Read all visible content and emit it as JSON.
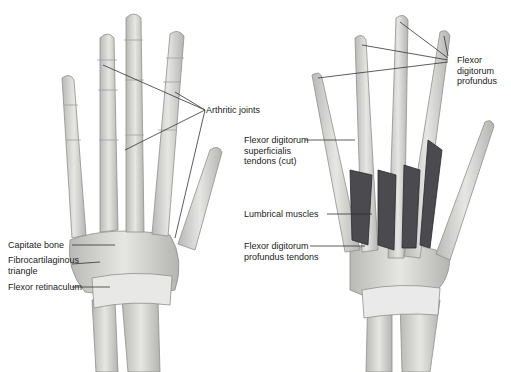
{
  "left_hand": {
    "labels": {
      "arthritic_joints": "Arthritic joints",
      "capitate_bone": "Capitate bone",
      "fibrocartilaginous_1": "Fibrocartilaginous",
      "fibrocartilaginous_2": "triangle",
      "flexor_retinaculum": "Flexor retinaculum"
    }
  },
  "right_hand": {
    "labels": {
      "fdp_1": "Flexor",
      "fdp_2": "digitorum",
      "fdp_3": "profundus",
      "fds_1": "Flexor digitorum",
      "fds_2": "superficialis",
      "fds_3": "tendons (cut)",
      "lumbrical": "Lumbrical muscles",
      "fdpt_1": "Flexor digitorum",
      "fdpt_2": "profundus tendons"
    }
  },
  "colors": {
    "bone": "#d9d9d6",
    "bone_edge": "#8f8f8c",
    "muscle": "#4a4a4f",
    "line": "#333333"
  }
}
